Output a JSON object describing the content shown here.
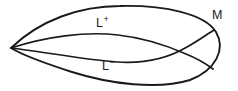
{
  "figure": {
    "type": "line-diagram",
    "background_color": "#ffffff",
    "stroke_color": "#1a1a1a",
    "width": 238,
    "height": 91,
    "labels": [
      {
        "id": "l-plus",
        "base": "L",
        "superscript": "+",
        "text": "L+",
        "x": 96,
        "y": 17
      },
      {
        "id": "l-minus",
        "base": "L",
        "superscript": "−",
        "text": "L−",
        "x": 102,
        "y": 60
      },
      {
        "id": "m",
        "base": "M",
        "superscript": "",
        "text": "M",
        "x": 212,
        "y": 8
      }
    ],
    "curves": [
      {
        "id": "outer-boundary",
        "name": "manifold-boundary-m",
        "closed": true,
        "path": "M 11 48 C 40 20 80 6 120 6 C 165 5 205 14 216 32 C 226 49 216 70 190 80 C 158 90 110 84 72 72 C 44 63 24 56 11 48 Z"
      },
      {
        "id": "inner-upper",
        "name": "curve-l-plus",
        "closed": false,
        "path": "M 11 48 C 45 37 85 31 118 35 C 145 38 168 46 186 54 C 196 58 205 63 213 69"
      },
      {
        "id": "inner-lower",
        "name": "curve-l-minus",
        "closed": false,
        "path": "M 11 48 C 46 52 86 60 117 62 C 146 64 170 57 187 47 C 198 41 206 35 214 30"
      }
    ],
    "crossings": [
      {
        "x": 133,
        "y": 48
      },
      {
        "x": 190,
        "y": 50
      }
    ]
  }
}
